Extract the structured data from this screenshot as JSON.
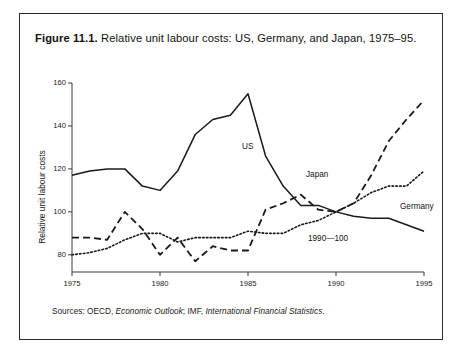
{
  "figure": {
    "label": "Figure 11.1.",
    "caption": "Relative unit labour costs: US, Germany, and Japan, 1975–95."
  },
  "sources": {
    "prefix": "Sources: OECD, ",
    "italic1": "Economic Outlook",
    "middle": "; IMF, ",
    "italic2": "International Financial Statistics",
    "suffix": "."
  },
  "annotations": {
    "base_note": "1990—100"
  },
  "chart_data": {
    "type": "line",
    "title": "Relative unit labour costs: US, Germany, and Japan, 1975–95",
    "xlabel": "",
    "ylabel": "Relative unit labour costs",
    "xlim": [
      1975,
      1995
    ],
    "ylim": [
      72,
      160
    ],
    "xticks": [
      1975,
      1980,
      1985,
      1990,
      1995
    ],
    "yticks": [
      80,
      100,
      120,
      140,
      160
    ],
    "grid": false,
    "legend": "inline-labels",
    "note": "1990—100",
    "x": [
      1975,
      1976,
      1977,
      1978,
      1979,
      1980,
      1981,
      1982,
      1983,
      1984,
      1985,
      1986,
      1987,
      1988,
      1989,
      1990,
      1991,
      1992,
      1993,
      1994,
      1995
    ],
    "series": [
      {
        "name": "US",
        "style": "solid",
        "values": [
          117,
          119,
          120,
          120,
          112,
          110,
          119,
          136,
          143,
          145,
          155,
          126,
          112,
          103,
          103,
          100,
          98,
          97,
          97,
          94,
          91
        ]
      },
      {
        "name": "Japan",
        "style": "dashed",
        "values": [
          88,
          88,
          87,
          100,
          92,
          80,
          88,
          77,
          84,
          82,
          82,
          101,
          104,
          108,
          101,
          100,
          104,
          117,
          133,
          143,
          152
        ]
      },
      {
        "name": "Germany",
        "style": "dotted",
        "values": [
          80,
          81,
          83,
          87,
          90,
          90,
          86,
          88,
          88,
          88,
          91,
          90,
          90,
          94,
          96,
          100,
          104,
          109,
          112,
          112,
          119
        ]
      }
    ]
  }
}
